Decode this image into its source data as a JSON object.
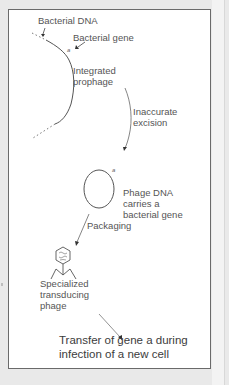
{
  "diagram": {
    "labels": {
      "bacterial_dna": "Bacterial DNA",
      "bacterial_gene": "Bacterial gene",
      "gene_letter": "a",
      "integrated_prophage_1": "Integrated",
      "integrated_prophage_2": "prophage",
      "inaccurate_excision_1": "Inaccurate",
      "inaccurate_excision_2": "excision",
      "phage_dna_1": "Phage DNA",
      "phage_dna_2": "carries a",
      "phage_dna_3": "bacterial gene",
      "circle_gene_letter": "a",
      "packaging": "Packaging",
      "specialized_1": "Specialized",
      "specialized_2": "transducing",
      "specialized_3": "phage",
      "transfer_1": "Transfer of gene a during",
      "transfer_2": "infection of a new cell"
    },
    "steps": [
      "Integrated prophage",
      "Inaccurate excision",
      "Phage DNA carries a bacterial gene",
      "Packaging",
      "Specialized transducing phage",
      "Transfer of gene a during infection of a new cell"
    ],
    "colors": {
      "background": "#e9e9e9",
      "panel": "#ffffff",
      "border": "#6a6a6a",
      "line": "#555555"
    }
  }
}
